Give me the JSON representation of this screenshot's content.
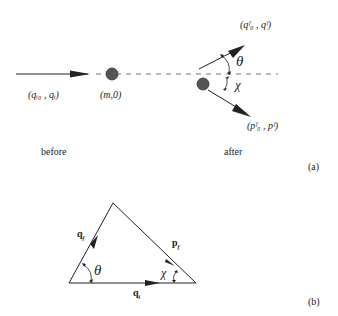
{
  "panel_a": {
    "incoming_label": "(q_i0 , q_i)",
    "incoming_label_display": "(qᵢ₀ , qᵢ)",
    "target_label": "(m,0)",
    "outgoing_photon_label": "(q_f0 , q_f)",
    "outgoing_photon_display": "(qᶠ₀ , qᶠ)",
    "recoil_label": "(p_f0 , p_f)",
    "recoil_display": "(pᶠ₀ , pᶠ)",
    "theta": "θ",
    "chi": "χ",
    "before": "before",
    "after": "after",
    "panel_tag": "(a)"
  },
  "panel_b": {
    "side_qf": "q_f",
    "side_pf": "p_f",
    "side_qi": "q_i",
    "theta": "θ",
    "chi": "χ",
    "panel_tag": "(b)"
  },
  "colors": {
    "line": "#222222",
    "dot": "#555555",
    "dash": "#777777"
  }
}
